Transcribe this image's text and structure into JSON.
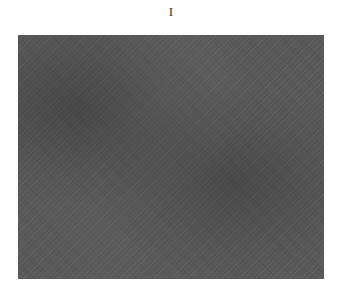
{
  "figure": {
    "label": "I",
    "plate_color": "#5a5a5a"
  }
}
